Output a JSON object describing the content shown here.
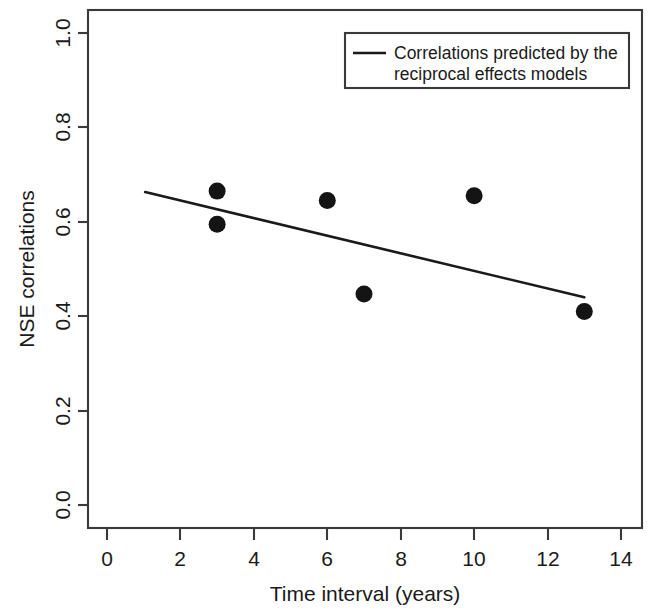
{
  "chart_data": {
    "type": "scatter",
    "title": "",
    "xlabel": "Time interval (years)",
    "ylabel": "NSE correlations",
    "xlim": [
      0,
      14
    ],
    "ylim": [
      0.0,
      1.0
    ],
    "xticks": [
      0,
      2,
      4,
      6,
      8,
      10,
      12,
      14
    ],
    "xtick_labels": [
      "0",
      "2",
      "4",
      "6",
      "8",
      "10",
      "12",
      "14"
    ],
    "yticks": [
      0.0,
      0.2,
      0.4,
      0.6,
      0.8,
      1.0
    ],
    "ytick_labels": [
      "0.0",
      "0.2",
      "0.4",
      "0.6",
      "0.8",
      "1.0"
    ],
    "grid": false,
    "legend_position": "top-right",
    "series": [
      {
        "name": "Observed NSE correlations",
        "type": "scatter",
        "marker": "filled-circle",
        "color": "#141414",
        "x": [
          3,
          3,
          6,
          7,
          10,
          13
        ],
        "y": [
          0.665,
          0.595,
          0.645,
          0.447,
          0.655,
          0.41
        ],
        "points": [
          {
            "x": 3,
            "y": 0.665
          },
          {
            "x": 3,
            "y": 0.595
          },
          {
            "x": 6,
            "y": 0.645
          },
          {
            "x": 7,
            "y": 0.447
          },
          {
            "x": 10,
            "y": 0.655
          },
          {
            "x": 13,
            "y": 0.41
          }
        ]
      },
      {
        "name": "Correlations predicted by the reciprocal effects models",
        "type": "line",
        "color": "#1a1a1a",
        "x": [
          1.04,
          13.0
        ],
        "y": [
          0.663,
          0.44
        ]
      }
    ]
  },
  "axes": {
    "x_axis_title": "Time interval (years)",
    "y_axis_title": "NSE correlations"
  },
  "legend": {
    "entries": [
      {
        "label_line_1": "Correlations predicted by the",
        "label_line_2": "reciprocal effects models",
        "marker": "line-sample",
        "color": "#1a1a1a"
      }
    ]
  },
  "colors": {
    "point": "#141414",
    "line": "#1a1a1a",
    "frame": "#3a3a3a",
    "background": "#ffffff"
  }
}
